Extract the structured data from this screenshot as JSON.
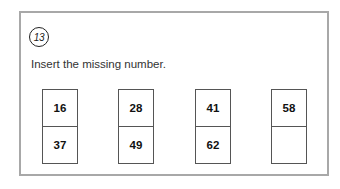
{
  "question": {
    "number": "13",
    "instruction": "Insert the missing number."
  },
  "pairs": [
    {
      "top": "16",
      "bottom": "37"
    },
    {
      "top": "28",
      "bottom": "49"
    },
    {
      "top": "41",
      "bottom": "62"
    },
    {
      "top": "58",
      "bottom": ""
    }
  ]
}
